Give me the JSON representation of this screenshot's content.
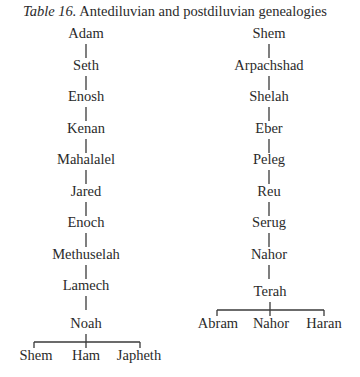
{
  "caption": {
    "label": "Table 16.",
    "text": " Antediluvian and postdiluvian genealogies"
  },
  "antediluvian": {
    "lineage": [
      "Adam",
      "Seth",
      "Enosh",
      "Kenan",
      "Mahalalel",
      "Jared",
      "Enoch",
      "Methuselah",
      "Lamech",
      "Noah"
    ],
    "children": [
      "Shem",
      "Ham",
      "Japheth"
    ]
  },
  "postdiluvian": {
    "lineage": [
      "Shem",
      "Arpachshad",
      "Shelah",
      "Eber",
      "Peleg",
      "Reu",
      "Serug",
      "Nahor",
      "Terah"
    ],
    "children": [
      "Abram",
      "Nahor",
      "Haran"
    ]
  }
}
